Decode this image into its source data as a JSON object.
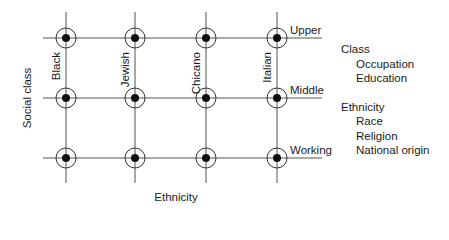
{
  "diagram": {
    "x_axis_label": "Ethnicity",
    "y_axis_label": "Social class",
    "columns": [
      {
        "label": "Black",
        "x": 66
      },
      {
        "label": "Jewish",
        "x": 135
      },
      {
        "label": "Chicano",
        "x": 206
      },
      {
        "label": "Italian",
        "x": 277
      }
    ],
    "rows": [
      {
        "label": "Upper",
        "y": 38
      },
      {
        "label": "Middle",
        "y": 98
      },
      {
        "label": "Working",
        "y": 158
      }
    ],
    "colors": {
      "line": "#555555",
      "dot": "#111111",
      "text": "#1a1a1a"
    }
  },
  "legend": {
    "groups": [
      {
        "title": "Class",
        "items": [
          "Occupation",
          "Education"
        ]
      },
      {
        "title": "Ethnicity",
        "items": [
          "Race",
          "Religion",
          "National origin"
        ]
      }
    ]
  }
}
